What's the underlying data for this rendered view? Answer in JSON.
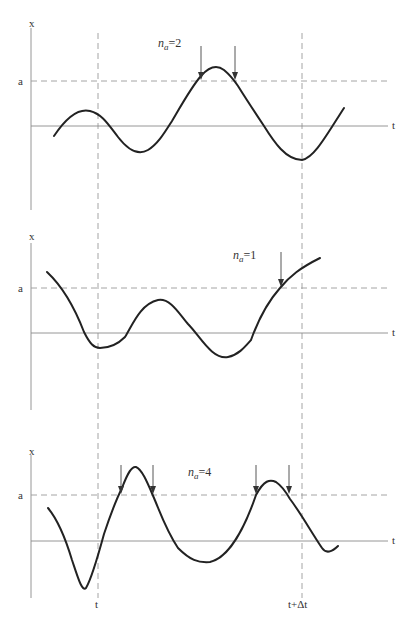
{
  "figure": {
    "vertical_markers": {
      "start_label": "t",
      "end_label": "t+Δt"
    },
    "panels": [
      {
        "y_axis_label": "x",
        "threshold_label": "a",
        "time_axis_label": "t",
        "count_label_n": "n",
        "count_label_sub": "a",
        "count_label_value": "=2",
        "crossings": 2
      },
      {
        "y_axis_label": "x",
        "threshold_label": "a",
        "time_axis_label": "t",
        "count_label_n": "n",
        "count_label_sub": "a",
        "count_label_value": "=1",
        "crossings": 1
      },
      {
        "y_axis_label": "x",
        "threshold_label": "a",
        "time_axis_label": "t",
        "count_label_n": "n",
        "count_label_sub": "a",
        "count_label_value": "=4",
        "crossings": 4
      }
    ]
  }
}
